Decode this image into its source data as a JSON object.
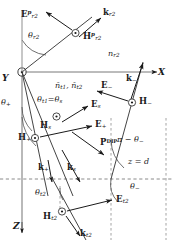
{
  "figure": {
    "kind": "electromagnetic-wave-interface-diagram",
    "axes": [
      {
        "name": "Y",
        "label": "Y",
        "note": "out-of-page at origin"
      },
      {
        "name": "X",
        "label": "X",
        "note": "horizontal right"
      },
      {
        "name": "Z",
        "label": "Z",
        "note": "vertical down"
      }
    ],
    "boundary": {
      "label_text": "z = d",
      "style": "dashed"
    },
    "media_index_upper": "n",
    "media_index_upper_sub": "r2",
    "refr_indices_label_1": "ñ",
    "refr_indices_sub_1": "t1",
    "refr_indices_label_2": "ñ",
    "refr_indices_sub_2": "t2"
  },
  "vectors": [
    {
      "id": "E-rp2",
      "symbol": "E",
      "sup": "p",
      "sub": "r2",
      "x": 21,
      "y": 12,
      "name": "vector-label-E-r2-p"
    },
    {
      "id": "k-r2",
      "symbol": "k",
      "sup": "",
      "sub": "r2",
      "x": 103,
      "y": 10,
      "name": "vector-label-k-r2"
    },
    {
      "id": "H-rp2",
      "symbol": "H",
      "sup": "p",
      "sub": "r2",
      "x": 83,
      "y": 34,
      "name": "vector-label-H-r2-p"
    },
    {
      "id": "E-minus",
      "symbol": "E",
      "sup": "",
      "sub": "−",
      "x": 103,
      "y": 83,
      "name": "vector-label-E-minus"
    },
    {
      "id": "k-minus",
      "symbol": "k",
      "sup": "",
      "sub": "−",
      "x": 128,
      "y": 76,
      "name": "vector-label-k-minus"
    },
    {
      "id": "H-minus",
      "symbol": "H",
      "sup": "",
      "sub": "−",
      "x": 139,
      "y": 99,
      "name": "vector-label-H-minus"
    },
    {
      "id": "E-s",
      "symbol": "E",
      "sup": "",
      "sub": "s",
      "x": 92,
      "y": 104,
      "name": "vector-label-E-s"
    },
    {
      "id": "H-s",
      "symbol": "H",
      "sup": "",
      "sub": "s",
      "x": 40,
      "y": 124,
      "name": "vector-label-H-s"
    },
    {
      "id": "E-plus",
      "symbol": "E",
      "sup": "",
      "sub": "+",
      "x": 96,
      "y": 123,
      "name": "vector-label-E-plus"
    },
    {
      "id": "H-plus",
      "symbol": "H",
      "sup": "",
      "sub": "+",
      "x": 19,
      "y": 143,
      "name": "vector-label-H-plus"
    },
    {
      "id": "k-plus",
      "symbol": "k",
      "sup": "",
      "sub": "+",
      "x": 38,
      "y": 172,
      "name": "vector-label-k-plus"
    },
    {
      "id": "k-s",
      "symbol": "k",
      "sup": "",
      "sub": "s",
      "x": 68,
      "y": 172,
      "name": "vector-label-k-s"
    },
    {
      "id": "E-t2",
      "symbol": "E",
      "sup": "",
      "sub": "t2",
      "x": 117,
      "y": 199,
      "name": "vector-label-E-t2"
    },
    {
      "id": "H-t2",
      "symbol": "H",
      "sup": "",
      "sub": "t2",
      "x": 44,
      "y": 215,
      "name": "vector-label-H-t2"
    },
    {
      "id": "k-t2",
      "symbol": "k",
      "sup": "",
      "sub": "t2",
      "x": 81,
      "y": 231,
      "name": "vector-label-k-t2"
    }
  ],
  "polarization": {
    "symbol": "P",
    "sup": "DIP",
    "x": 101,
    "y": 142,
    "name": "vector-label-P-dip"
  },
  "angles": [
    {
      "id": "theta-r2",
      "text": "θ",
      "sub": "r2",
      "x": 29,
      "y": 35,
      "name": "angle-label-theta-r2"
    },
    {
      "id": "theta-plus",
      "text": "θ",
      "sub": "+",
      "x": 2,
      "y": 101,
      "name": "angle-label-theta-plus"
    },
    {
      "id": "theta-t1",
      "text": "θ",
      "sub": "t1",
      "eq": "=",
      "text2": "θ",
      "sub2": "s",
      "x": 38,
      "y": 98,
      "name": "angle-label-theta-t1-eq-theta-s"
    },
    {
      "id": "theta-minus",
      "text": "π − θ",
      "sub": "−",
      "x": 118,
      "y": 138,
      "name": "angle-label-pi-minus-theta-minus"
    },
    {
      "id": "theta-minus-2",
      "text": "θ",
      "sub": "−",
      "x": 131,
      "y": 185,
      "name": "angle-label-theta-minus"
    },
    {
      "id": "theta-t2",
      "text": "θ",
      "sub": "t2",
      "x": 36,
      "y": 191,
      "name": "angle-label-theta-t2"
    }
  ],
  "axis_labels": [
    {
      "id": "Y",
      "text": "Y",
      "x": 2,
      "y": 78,
      "name": "axis-label-y"
    },
    {
      "id": "X",
      "text": "X",
      "x": 158,
      "y": 74,
      "name": "axis-label-x"
    },
    {
      "id": "Z",
      "text": "Z",
      "x": 13,
      "y": 226,
      "name": "axis-label-z"
    }
  ],
  "colors": {
    "ink": "#1a1a1a",
    "line": "#3a3a3a",
    "dash": "#8a8a8a",
    "axis": "#9a9a9a"
  }
}
